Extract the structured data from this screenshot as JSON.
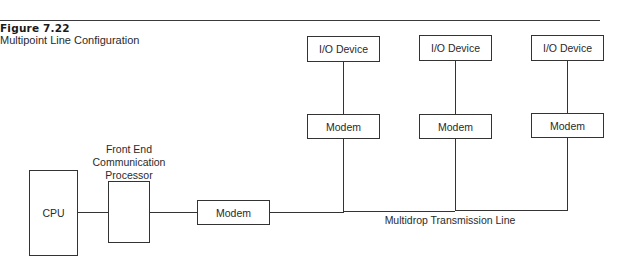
{
  "figure": {
    "number": "Figure 7.22",
    "title": "Multipoint Line Configuration"
  },
  "nodes": {
    "cpu": "CPU",
    "fep_label_line1": "Front End",
    "fep_label_line2": "Communication",
    "fep_label_line3": "Processor",
    "host_modem": "Modem",
    "drops": [
      {
        "device": "I/O Device",
        "modem": "Modem"
      },
      {
        "device": "I/O Device",
        "modem": "Modem"
      },
      {
        "device": "I/O Device",
        "modem": "Modem"
      }
    ]
  },
  "line_label": "Multidrop Transmission Line"
}
